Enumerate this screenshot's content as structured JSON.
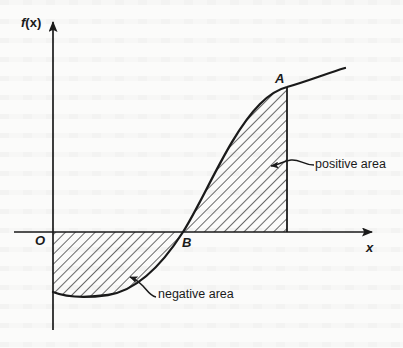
{
  "figure": {
    "type": "diagram",
    "background_color": "#fbfbfa",
    "ink_color": "#1a1a1a"
  },
  "axes": {
    "y_label": "f(x)",
    "y_label_func": "f",
    "y_label_arg": "(x)",
    "x_label": "x",
    "origin_label": "O",
    "x_axis_y_px": 232,
    "y_axis_x_px": 53,
    "x_axis_end_px": 382,
    "y_axis_top_px": 12,
    "y_axis_bottom_px": 330,
    "x_axis_start_px": 14
  },
  "points": [
    {
      "label": "A",
      "x_px": 287,
      "y_px": 87,
      "note": "upper endpoint of curve segment"
    },
    {
      "label": "B",
      "x_px": 183,
      "y_px": 232,
      "note": "curve crosses the x-axis"
    }
  ],
  "regions": [
    {
      "name": "positive-area",
      "label": "positive area",
      "sign": "positive",
      "hatch": "diagonal",
      "bounds": "between curve B-A, vertical line at A, and the x-axis"
    },
    {
      "name": "negative-area",
      "label": "negative area",
      "sign": "negative",
      "hatch": "diagonal",
      "bounds": "between the x-axis, the y-axis and the curve below the axis up to B"
    }
  ],
  "annotations": [
    {
      "name": "positive-area-callout",
      "text": "positive area",
      "leader_from_px": [
        315,
        165
      ],
      "leader_to_px": [
        270,
        165
      ]
    },
    {
      "name": "negative-area-callout",
      "text": "negative area",
      "leader_from_px": [
        155,
        296
      ],
      "leader_to_px": [
        128,
        276
      ]
    }
  ],
  "curve": {
    "description": "cubic-like S curve: starts below axis near the y-axis, dips to a minimum, rises through B on the axis, inflects and climbs to A and beyond",
    "path": "M 53 292 C 68 298, 86 298, 108 295 C 134 291, 160 268, 183 232 C 205 197, 230 134, 260 104 C 270 94, 279 89, 287 87 C 308 81, 328 73, 345 68"
  }
}
